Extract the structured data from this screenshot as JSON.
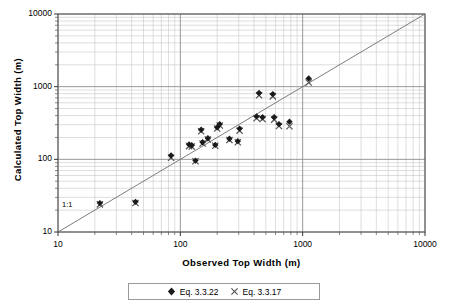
{
  "figure": {
    "background_color": "#ffffff",
    "plot_area": {
      "left": 58,
      "top": 14,
      "right": 425,
      "bottom": 232
    },
    "frame_color": "#555555",
    "major_grid_color": "#8c8c8c",
    "minor_grid_color": "#c8c8c8",
    "series_colors": {
      "eq_3322": "#1a1a1a",
      "eq_3317": "#555555"
    },
    "reference_line_color": "#6e6e6e"
  },
  "axes": {
    "x": {
      "title": "Observed Top Width (m)",
      "scale": "log",
      "min": 10,
      "max": 10000,
      "tick_labels": [
        "10",
        "100",
        "1000",
        "10000"
      ],
      "tick_values": [
        10,
        100,
        1000,
        10000
      ]
    },
    "y": {
      "title": "Calculated Top Width (m)",
      "scale": "log",
      "min": 10,
      "max": 10000,
      "tick_labels": [
        "10",
        "100",
        "1000",
        "10000"
      ],
      "tick_values": [
        10,
        100,
        1000,
        10000
      ]
    }
  },
  "annotations": [
    {
      "name": "one-to-one-line-label",
      "text": "1:1"
    }
  ],
  "legend": {
    "position": "below-axis-title",
    "entries": [
      {
        "label": "Eq. 3.3.22",
        "marker": "diamond-marker",
        "color": "#1a1a1a"
      },
      {
        "label": "Eq. 3.3.17",
        "marker": "cross-marker",
        "color": "#555555"
      }
    ]
  },
  "chart_data": {
    "type": "scatter",
    "title": "",
    "xlabel": "Observed Top Width (m)",
    "ylabel": "Calculated Top Width (m)",
    "xscale": "log",
    "yscale": "log",
    "xlim": [
      10,
      10000
    ],
    "ylim": [
      10,
      10000
    ],
    "grid": true,
    "legend_position": "bottom",
    "reference_line": {
      "label": "1:1",
      "slope": 1,
      "intercept": 0,
      "from": [
        10,
        10
      ],
      "to": [
        10000,
        10000
      ]
    },
    "series": [
      {
        "name": "Eq. 3.3.22",
        "marker": "diamond",
        "color": "#1a1a1a",
        "points": [
          [
            22,
            25
          ],
          [
            43,
            26
          ],
          [
            84,
            113
          ],
          [
            118,
            160
          ],
          [
            124,
            156
          ],
          [
            133,
            96
          ],
          [
            148,
            255
          ],
          [
            152,
            172
          ],
          [
            168,
            195
          ],
          [
            193,
            158
          ],
          [
            200,
            275
          ],
          [
            210,
            305
          ],
          [
            252,
            192
          ],
          [
            295,
            178
          ],
          [
            305,
            265
          ],
          [
            420,
            390
          ],
          [
            440,
            820
          ],
          [
            470,
            380
          ],
          [
            570,
            790
          ],
          [
            585,
            380
          ],
          [
            640,
            305
          ],
          [
            780,
            330
          ],
          [
            1120,
            1300
          ]
        ]
      },
      {
        "name": "Eq. 3.3.17",
        "marker": "cross",
        "color": "#555555",
        "points": [
          [
            22,
            24
          ],
          [
            43,
            25
          ],
          [
            84,
            105
          ],
          [
            118,
            152
          ],
          [
            124,
            150
          ],
          [
            133,
            94
          ],
          [
            148,
            243
          ],
          [
            152,
            165
          ],
          [
            168,
            188
          ],
          [
            193,
            154
          ],
          [
            200,
            265
          ],
          [
            210,
            292
          ],
          [
            252,
            185
          ],
          [
            295,
            172
          ],
          [
            305,
            248
          ],
          [
            420,
            368
          ],
          [
            440,
            760
          ],
          [
            470,
            358
          ],
          [
            570,
            735
          ],
          [
            585,
            352
          ],
          [
            640,
            288
          ],
          [
            780,
            285
          ],
          [
            1120,
            1140
          ]
        ]
      }
    ]
  }
}
